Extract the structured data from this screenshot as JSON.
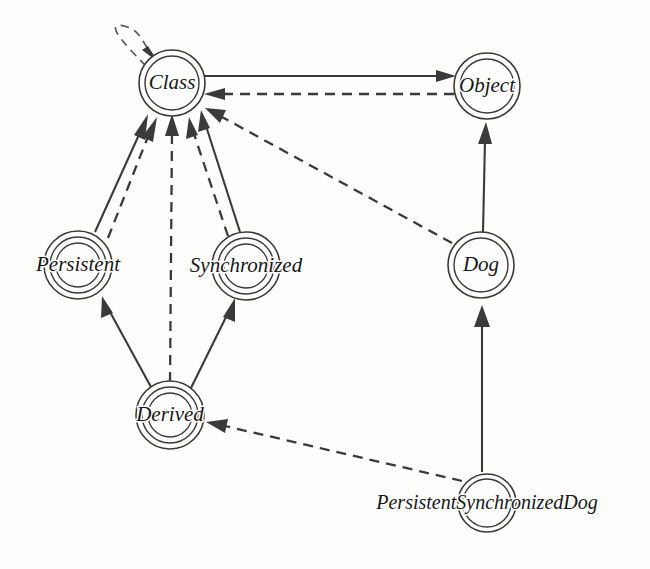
{
  "diagram": {
    "type": "directed-graph",
    "background_color": "#fdfdfc",
    "stroke_color": "#3a3a3a",
    "label_color": "#17171a",
    "nodes": [
      {
        "id": "class",
        "label": "Class",
        "cx": 172,
        "cy": 83,
        "rings": 2,
        "outer_r": 33,
        "label_overflow": false
      },
      {
        "id": "object",
        "label": "Object",
        "cx": 487,
        "cy": 86,
        "rings": 2,
        "outer_r": 33,
        "label_overflow": false
      },
      {
        "id": "persistent",
        "label": "Persistent",
        "cx": 78,
        "cy": 265,
        "rings": 3,
        "outer_r": 34,
        "label_overflow": true
      },
      {
        "id": "synchronized",
        "label": "Synchronized",
        "cx": 246,
        "cy": 266,
        "rings": 3,
        "outer_r": 34,
        "label_overflow": true
      },
      {
        "id": "dog",
        "label": "Dog",
        "cx": 481,
        "cy": 265,
        "rings": 2,
        "outer_r": 33,
        "label_overflow": false
      },
      {
        "id": "derived",
        "label": "Derived",
        "cx": 170,
        "cy": 415,
        "rings": 3,
        "outer_r": 34,
        "label_overflow": true
      },
      {
        "id": "persistentsynchronizeddog",
        "label": "PersistentSynchronizedDog",
        "cx": 487,
        "cy": 503,
        "rings": 2,
        "outer_r": 29,
        "label_overflow": true
      }
    ],
    "edges": [
      {
        "id": "class-self",
        "from": "class",
        "to": "class",
        "style": "dashed",
        "kind": "self-loop"
      },
      {
        "id": "class-object",
        "from": "class",
        "to": "object",
        "style": "solid",
        "kind": "straight"
      },
      {
        "id": "object-class",
        "from": "object",
        "to": "class",
        "style": "dashed",
        "kind": "straight"
      },
      {
        "id": "persistent-class-solid",
        "from": "persistent",
        "to": "class",
        "style": "solid",
        "kind": "straight"
      },
      {
        "id": "persistent-class-dashed",
        "from": "persistent",
        "to": "class",
        "style": "dashed",
        "kind": "straight"
      },
      {
        "id": "derived-class-dashed",
        "from": "derived",
        "to": "class",
        "style": "dashed",
        "kind": "straight"
      },
      {
        "id": "synchronized-class-dashed",
        "from": "synchronized",
        "to": "class",
        "style": "dashed",
        "kind": "straight"
      },
      {
        "id": "synchronized-class-solid",
        "from": "synchronized",
        "to": "class",
        "style": "solid",
        "kind": "straight"
      },
      {
        "id": "dog-class-dashed",
        "from": "dog",
        "to": "class",
        "style": "dashed",
        "kind": "straight"
      },
      {
        "id": "dog-object-solid",
        "from": "dog",
        "to": "object",
        "style": "solid",
        "kind": "straight"
      },
      {
        "id": "derived-persistent",
        "from": "derived",
        "to": "persistent",
        "style": "solid",
        "kind": "straight"
      },
      {
        "id": "derived-synchronized",
        "from": "derived",
        "to": "synchronized",
        "style": "solid",
        "kind": "straight"
      },
      {
        "id": "psd-dog-solid",
        "from": "persistentsynchronizeddog",
        "to": "dog",
        "style": "solid",
        "kind": "straight"
      },
      {
        "id": "psd-derived-dashed",
        "from": "persistentsynchronizeddog",
        "to": "derived",
        "style": "dashed",
        "kind": "straight"
      }
    ]
  }
}
